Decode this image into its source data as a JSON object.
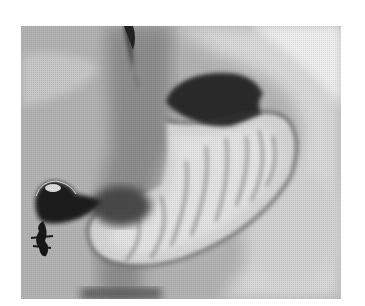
{
  "image": {
    "description": "Grayscale barium fluoroscopic radiograph of the stomach",
    "colors": {
      "background": "#ffffff",
      "soft_tissue": "#b4b4b4",
      "bright_region": "#e6e6e6",
      "gas_bubble": "#2e2e2e",
      "contrast_dark": "#1c1c1c",
      "mucosal_folds": "#555555"
    }
  }
}
